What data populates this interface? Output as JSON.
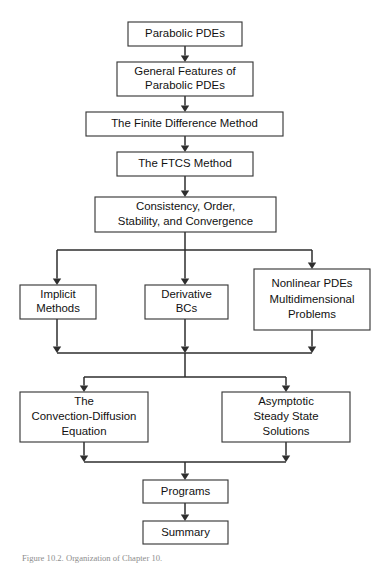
{
  "figure": {
    "type": "flowchart",
    "title": "Organization of Chapter 10",
    "caption": "Figure 10.2. Organization of Chapter 10.",
    "orientation": "top-to-bottom",
    "background_color": "#ffffff",
    "box_stroke_color": "#3a3a3a",
    "connector_color": "#2e2e2e",
    "text_color": "#111111"
  },
  "nodes": [
    {
      "id": "parabolic-pdes",
      "lines": [
        "Parabolic PDEs"
      ],
      "x": 128,
      "y": 22,
      "w": 114,
      "h": 24,
      "level": 0
    },
    {
      "id": "general-features",
      "lines": [
        "General Features of",
        "Parabolic PDEs"
      ],
      "x": 117,
      "y": 62,
      "w": 136,
      "h": 34,
      "level": 1
    },
    {
      "id": "finite-difference-method",
      "lines": [
        "The Finite Difference Method"
      ],
      "x": 86,
      "y": 112,
      "w": 197,
      "h": 24,
      "level": 2
    },
    {
      "id": "ftcs-method",
      "lines": [
        "The FTCS Method"
      ],
      "x": 117,
      "y": 152,
      "w": 136,
      "h": 24,
      "level": 3
    },
    {
      "id": "consistency-order-stability",
      "lines": [
        "Consistency, Order,",
        "Stability, and Convergence"
      ],
      "x": 95,
      "y": 197,
      "w": 181,
      "h": 35,
      "level": 4
    },
    {
      "id": "implicit-methods",
      "lines": [
        "Implicit",
        "Methods"
      ],
      "x": 20,
      "y": 285,
      "w": 76,
      "h": 34,
      "level": 5
    },
    {
      "id": "derivative-bcs",
      "lines": [
        "Derivative",
        "BCs"
      ],
      "x": 145,
      "y": 285,
      "w": 83,
      "h": 34,
      "level": 5
    },
    {
      "id": "nonlinear-multidimensional",
      "lines": [
        "Nonlinear PDEs",
        "Multidimensional",
        "Problems"
      ],
      "x": 254,
      "y": 269,
      "w": 116,
      "h": 61,
      "level": 5
    },
    {
      "id": "convection-diffusion",
      "lines": [
        "The",
        "Convection-Diffusion",
        "Equation"
      ],
      "x": 20,
      "y": 392,
      "w": 128,
      "h": 50,
      "level": 6
    },
    {
      "id": "asymptotic-steady-state",
      "lines": [
        "Asymptotic",
        "Steady State",
        "Solutions"
      ],
      "x": 222,
      "y": 392,
      "w": 128,
      "h": 50,
      "level": 6
    },
    {
      "id": "programs",
      "lines": [
        "Programs"
      ],
      "x": 143,
      "y": 480,
      "w": 85,
      "h": 23,
      "level": 7
    },
    {
      "id": "summary",
      "lines": [
        "Summary"
      ],
      "x": 143,
      "y": 521,
      "w": 85,
      "h": 23,
      "level": 8
    }
  ],
  "edges": [
    {
      "id": "e-parabolic-to-general",
      "from": "parabolic-pdes",
      "to": "general-features",
      "kind": "straight",
      "x": 185,
      "y1": 46,
      "y2": 62
    },
    {
      "id": "e-general-to-fdm",
      "from": "general-features",
      "to": "finite-difference-method",
      "kind": "straight",
      "x": 185,
      "y1": 96,
      "y2": 112
    },
    {
      "id": "e-fdm-to-ftcs",
      "from": "finite-difference-method",
      "to": "ftcs-method",
      "kind": "straight",
      "x": 185,
      "y1": 136,
      "y2": 152
    },
    {
      "id": "e-ftcs-to-consistency",
      "from": "ftcs-method",
      "to": "consistency-order-stability",
      "kind": "straight",
      "x": 185,
      "y1": 176,
      "y2": 197
    },
    {
      "id": "e-consistency-to-split",
      "from": "consistency-order-stability",
      "to": "split-bar-upper",
      "kind": "stem",
      "x": 185,
      "y1": 232,
      "y2": 250
    },
    {
      "id": "e-split-to-implicit",
      "from": "split-bar-upper",
      "to": "implicit-methods",
      "kind": "branch",
      "x": 57,
      "y1": 250,
      "y2": 285
    },
    {
      "id": "e-split-to-derivative",
      "from": "split-bar-upper",
      "to": "derivative-bcs",
      "kind": "branch",
      "x": 185,
      "y1": 250,
      "y2": 285
    },
    {
      "id": "e-split-to-nonlinear",
      "from": "split-bar-upper",
      "to": "nonlinear-multidimensional",
      "kind": "branch",
      "x": 312,
      "y1": 250,
      "y2": 269
    },
    {
      "id": "e-implicit-to-merge",
      "from": "implicit-methods",
      "to": "merge-bar-upper",
      "kind": "branch",
      "x": 57,
      "y1": 319,
      "y2": 353
    },
    {
      "id": "e-derivative-to-merge",
      "from": "derivative-bcs",
      "to": "merge-bar-upper",
      "kind": "branch",
      "x": 185,
      "y1": 319,
      "y2": 353
    },
    {
      "id": "e-nonlinear-to-merge",
      "from": "nonlinear-multidimensional",
      "to": "merge-bar-upper",
      "kind": "branch",
      "x": 312,
      "y1": 330,
      "y2": 353
    },
    {
      "id": "e-merge-to-split-lower",
      "from": "merge-bar-upper",
      "to": "split-bar-lower",
      "kind": "stem",
      "x": 185,
      "y1": 353,
      "y2": 377
    },
    {
      "id": "e-split-to-convection",
      "from": "split-bar-lower",
      "to": "convection-diffusion",
      "kind": "branch",
      "x": 84,
      "y1": 377,
      "y2": 392
    },
    {
      "id": "e-split-to-asymptotic",
      "from": "split-bar-lower",
      "to": "asymptotic-steady-state",
      "kind": "branch",
      "x": 286,
      "y1": 377,
      "y2": 392
    },
    {
      "id": "e-convection-to-merge",
      "from": "convection-diffusion",
      "to": "merge-bar-lower",
      "kind": "branch",
      "x": 84,
      "y1": 442,
      "y2": 462
    },
    {
      "id": "e-asymptotic-to-merge",
      "from": "asymptotic-steady-state",
      "to": "merge-bar-lower",
      "kind": "branch",
      "x": 286,
      "y1": 442,
      "y2": 462
    },
    {
      "id": "e-merge-to-programs",
      "from": "merge-bar-lower",
      "to": "programs",
      "kind": "stem",
      "x": 185,
      "y1": 462,
      "y2": 480
    },
    {
      "id": "e-programs-to-summary",
      "from": "programs",
      "to": "summary",
      "kind": "straight",
      "x": 185,
      "y1": 503,
      "y2": 521
    }
  ],
  "bars": [
    {
      "id": "split-bar-upper",
      "role": "distribute",
      "y": 250,
      "x1": 57,
      "x2": 312
    },
    {
      "id": "merge-bar-upper",
      "role": "collect",
      "y": 353,
      "x1": 57,
      "x2": 312
    },
    {
      "id": "split-bar-lower",
      "role": "distribute",
      "y": 377,
      "x1": 84,
      "x2": 286
    },
    {
      "id": "merge-bar-lower",
      "role": "collect",
      "y": 462,
      "x1": 84,
      "x2": 286
    }
  ]
}
